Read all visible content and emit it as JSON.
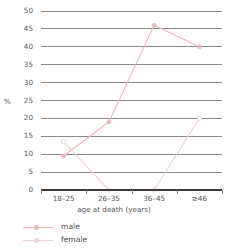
{
  "chart_data": {
    "type": "line",
    "title": "",
    "xlabel": "age at death (years)",
    "ylabel": "%",
    "categories": [
      "18–25",
      "26–35",
      "36–45",
      "≥46"
    ],
    "ylim": [
      0,
      50
    ],
    "ytick_step": 5,
    "yticks": [
      0,
      5,
      10,
      15,
      20,
      25,
      30,
      35,
      40,
      45,
      50
    ],
    "grid": true,
    "legend_position": "bottom-left",
    "series": [
      {
        "name": "male",
        "color": "#e8b9bd",
        "marker": "circle-filled",
        "values": [
          9.5,
          19,
          46,
          40
        ]
      },
      {
        "name": "female",
        "color": "#efd2d4",
        "marker": "circle-open",
        "values": [
          13.5,
          0,
          0,
          20
        ]
      }
    ]
  },
  "axis": {
    "y_title": "%",
    "x_title": "age at death (years)",
    "y_labels": [
      "50",
      "45",
      "40",
      "35",
      "30",
      "25",
      "20",
      "15",
      "10",
      "5",
      "0"
    ],
    "x_labels": [
      "18–25",
      "26–35",
      "36–45",
      "≥46"
    ]
  },
  "legend": {
    "items": [
      {
        "label": "male",
        "color": "#e8b9bd"
      },
      {
        "label": "female",
        "color": "#efd2d4"
      }
    ]
  },
  "colors": {
    "gridline": "#8a8a8a",
    "axis": "#3a3a3a",
    "text": "#555555",
    "background": "#ffffff",
    "male": "#e8b9bd",
    "female": "#efd2d4"
  }
}
